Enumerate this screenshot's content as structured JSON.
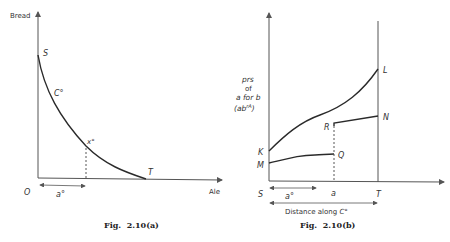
{
  "figures": [
    {
      "id": "a",
      "caption": "Fig.  2.10(a)",
      "y_axis_label": "Bread",
      "x_axis_label": "Ale",
      "origin_label": "O",
      "point_labels": {
        "S": "S",
        "T": "T",
        "x0": "x°"
      },
      "curve_label": "C°",
      "interval_label": "a°"
    },
    {
      "id": "b",
      "caption": "Fig.  2.10(b)",
      "y_axis_label_lines": [
        "prs",
        "of",
        "a for b",
        "(ab"
      ],
      "y_axis_sup": "rA",
      "y_axis_close": ")",
      "point_labels": {
        "K": "K",
        "M": "M",
        "Q": "Q",
        "R": "R",
        "L": "L",
        "N": "N",
        "S": "S",
        "a": "a",
        "T": "T"
      },
      "interval_label": "a°",
      "distance_label": "Distance along ",
      "distance_curve": "C°"
    }
  ],
  "colors": {
    "line": "#2a2a2a",
    "axis": "#555555"
  }
}
